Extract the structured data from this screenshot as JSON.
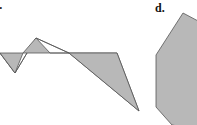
{
  "panels": [
    {
      "label": "c.",
      "shape": "self-intersecting polygon"
    },
    {
      "label": "d.",
      "shape": "convex polygon"
    }
  ],
  "colors": {
    "fill": "#b8b8b8",
    "stroke": "#555555"
  }
}
